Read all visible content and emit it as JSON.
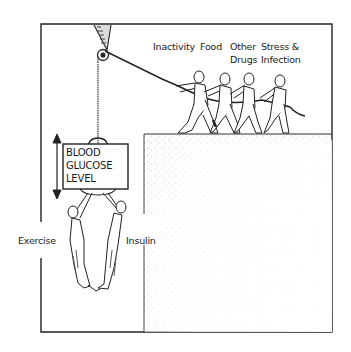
{
  "diagram": {
    "center_box": {
      "lines": [
        "BLOOD",
        "GLUCOSE",
        "LEVEL"
      ]
    },
    "raising_factors": [
      {
        "line1": "Inactivity",
        "line2": ""
      },
      {
        "line1": "Food",
        "line2": ""
      },
      {
        "line1": "Other",
        "line2": "Drugs"
      },
      {
        "line1": "Stress &",
        "line2": "Infection"
      }
    ],
    "lowering_factors": [
      {
        "label": "Exercise"
      },
      {
        "label": "Insulin"
      }
    ],
    "colors": {
      "ink": "#1a1a1a",
      "background": "#ffffff",
      "stipple": "#555555"
    }
  }
}
